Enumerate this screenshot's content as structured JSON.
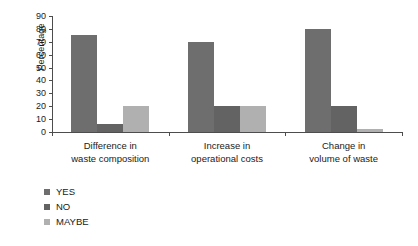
{
  "chart_data": {
    "type": "bar",
    "title": "",
    "xlabel": "",
    "ylabel": "Percentage",
    "ylim": [
      0,
      90
    ],
    "ytick_step": 10,
    "yticks": [
      90,
      80,
      70,
      60,
      50,
      40,
      30,
      20,
      10,
      0
    ],
    "grid": false,
    "legend_position": "bottom-left",
    "categories": [
      "Difference in\nwaste composition",
      "Increase in\noperational costs",
      "Change in\nvolume of waste"
    ],
    "category_lines": [
      [
        "Difference in",
        "waste composition"
      ],
      [
        "Increase in",
        "operational costs"
      ],
      [
        "Change in",
        "volume of waste"
      ]
    ],
    "series": [
      {
        "name": "YES",
        "color": "#6e6e6e",
        "values": [
          75,
          70,
          80
        ]
      },
      {
        "name": "NO",
        "color": "#636363",
        "values": [
          6,
          20,
          20
        ]
      },
      {
        "name": "MAYBE",
        "color": "#b0b0b0",
        "values": [
          20,
          20,
          2
        ]
      }
    ]
  },
  "legend": {
    "items": [
      {
        "label": "YES",
        "color": "#6e6e6e"
      },
      {
        "label": "NO",
        "color": "#636363"
      },
      {
        "label": "MAYBE",
        "color": "#b0b0b0"
      }
    ]
  },
  "axis": {
    "y_title": "Percentage"
  }
}
